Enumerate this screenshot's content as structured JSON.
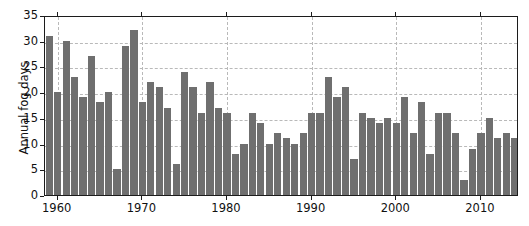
{
  "figure": {
    "top_caption_fragment": "",
    "background_color": "#ffffff"
  },
  "axes": {
    "ylabel": "Annual fog days",
    "xlabel": "",
    "bar_color": "#6f6f6f",
    "grid_color": "#b9b9b9",
    "frame_color": "#1c1c1c"
  },
  "chart_data": {
    "type": "bar",
    "title": "",
    "xlabel": "",
    "ylabel": "Annual fog days",
    "xlim": [
      1958.5,
      2014.5
    ],
    "ylim": [
      0,
      35
    ],
    "yticks": [
      0,
      5,
      10,
      15,
      20,
      25,
      30,
      35
    ],
    "xticks": [
      1960,
      1970,
      1980,
      1990,
      2000,
      2010
    ],
    "ytick_labels": [
      "0",
      "5",
      "10",
      "15",
      "20",
      "25",
      "30",
      "35"
    ],
    "xtick_labels": [
      "1960",
      "1970",
      "1980",
      "1990",
      "2000",
      "2010"
    ],
    "grid": true,
    "grid_style": "dashed",
    "legend": null,
    "series_name": "Annual fog days",
    "categories": [
      1959,
      1960,
      1961,
      1962,
      1963,
      1964,
      1965,
      1966,
      1967,
      1968,
      1969,
      1970,
      1971,
      1972,
      1973,
      1974,
      1975,
      1976,
      1977,
      1978,
      1979,
      1980,
      1981,
      1982,
      1983,
      1984,
      1985,
      1986,
      1987,
      1988,
      1989,
      1990,
      1991,
      1992,
      1993,
      1994,
      1995,
      1996,
      1997,
      1998,
      1999,
      2000,
      2001,
      2002,
      2003,
      2004,
      2005,
      2006,
      2007,
      2008,
      2009,
      2010,
      2011,
      2012,
      2013,
      2014
    ],
    "values": [
      31,
      20,
      30,
      23,
      19,
      27,
      18,
      20,
      5,
      29,
      32,
      18,
      22,
      21,
      17,
      6,
      24,
      21,
      16,
      22,
      17,
      16,
      8,
      10,
      16,
      14,
      10,
      12,
      11,
      10,
      12,
      16,
      16,
      23,
      19,
      21,
      7,
      16,
      15,
      14,
      15,
      14,
      19,
      12,
      18,
      8,
      16,
      16,
      12,
      3,
      9,
      12,
      15,
      11,
      12,
      11
    ]
  }
}
